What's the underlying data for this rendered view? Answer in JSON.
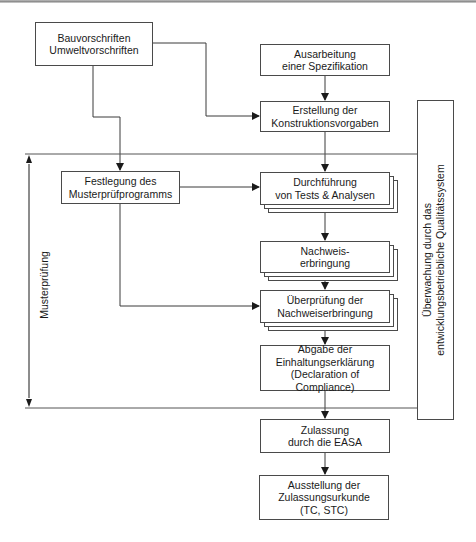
{
  "diagram": {
    "type": "flowchart",
    "language": "de",
    "nodes": {
      "regulations": "Bauvorschriften\nUmweltvorschriften",
      "specification": "Ausarbeitung\neiner Spezifikation",
      "design_specs": "Erstellung der\nKonstruktionsvorgaben",
      "test_program": "Festlegung des\nMusterprüfprogramms",
      "tests": "Durchführung\nvon Tests & Analysen",
      "evidence": "Nachweis-\nerbringung",
      "evidence_review": "Überprüfung der\nNachweiserbringung",
      "declaration": "Abgabe der\nEinhaltungserklärung\n(Declaration of Compliance)",
      "approval": "Zulassung\ndurch die EASA",
      "certificate": "Ausstellung der\nZulassungsurkunde\n(TC, STC)"
    },
    "side_labels": {
      "left_bracket": "Musterprüfung",
      "right_box": "Überwachung durch das\nentwicklungsbetriebliche Qualitätssystem"
    },
    "edges": [
      {
        "from": "regulations",
        "to": "design_specs"
      },
      {
        "from": "regulations",
        "to": "test_program"
      },
      {
        "from": "specification",
        "to": "design_specs"
      },
      {
        "from": "design_specs",
        "to": "tests"
      },
      {
        "from": "test_program",
        "to": "tests"
      },
      {
        "from": "test_program",
        "to": "evidence_review"
      },
      {
        "from": "tests",
        "to": "evidence"
      },
      {
        "from": "evidence",
        "to": "evidence_review"
      },
      {
        "from": "evidence_review",
        "to": "declaration"
      },
      {
        "from": "declaration",
        "to": "approval"
      },
      {
        "from": "approval",
        "to": "certificate"
      }
    ],
    "colors": {
      "line": "#3a3a3a",
      "box_border": "#4a4a4a",
      "background": "#ffffff"
    }
  }
}
